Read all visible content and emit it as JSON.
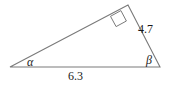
{
  "figure": {
    "stroke_color": "#7a7a7a",
    "text_color": "#1a1a1a",
    "background_color": "#ffffff",
    "vertices": {
      "left": {
        "x": 10,
        "y": 67,
        "name": "alpha-vertex"
      },
      "top": {
        "x": 128,
        "y": 5,
        "name": "right-angle-vertex"
      },
      "right": {
        "x": 160,
        "y": 67,
        "name": "beta-vertex"
      }
    },
    "right_angle_marker": {
      "name": "right-angle-square",
      "points": "120.9,10.6 126.4,21.0 116.1,26.6 110.5,16.3"
    },
    "labels": {
      "side_right": "4.7",
      "side_base": "6.3",
      "angle_left": "α",
      "angle_right": "β"
    }
  },
  "chart_data": {
    "type": "diagram",
    "shape": "right triangle",
    "title": "",
    "annotations": [
      {
        "name": "side-right-length",
        "text": "4.7",
        "kind": "side-length",
        "attached_to": "top-right-side"
      },
      {
        "name": "side-base-length",
        "text": "6.3",
        "kind": "side-length",
        "attached_to": "base-side"
      },
      {
        "name": "angle-alpha",
        "text": "α",
        "kind": "angle",
        "attached_to": "left-vertex"
      },
      {
        "name": "angle-beta",
        "text": "β",
        "kind": "angle",
        "attached_to": "right-vertex"
      },
      {
        "name": "right-angle",
        "text": "90°",
        "kind": "right-angle-marker",
        "attached_to": "top-vertex"
      }
    ],
    "measured_sides": {
      "right_side": 4.7,
      "base": 6.3
    },
    "unlabeled_sides": [
      "left-upper-side"
    ],
    "angles_labeled": [
      "α",
      "β"
    ],
    "right_angle_at": "top-vertex"
  }
}
